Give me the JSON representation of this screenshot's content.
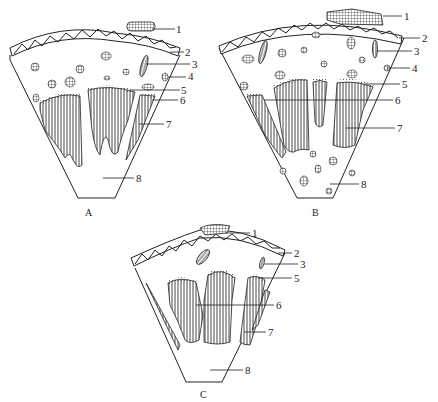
{
  "figure": {
    "panels": [
      {
        "id": "A",
        "caption": "A",
        "labels": [
          "1",
          "2",
          "3",
          "4",
          "5",
          "6",
          "7",
          "8"
        ]
      },
      {
        "id": "B",
        "caption": "B",
        "labels": [
          "1",
          "2",
          "3",
          "4",
          "5",
          "6",
          "7",
          "8"
        ]
      },
      {
        "id": "C",
        "caption": "C",
        "labels": [
          "1",
          "2",
          "3",
          "5",
          "6",
          "7",
          "8"
        ]
      }
    ],
    "colors": {
      "ink": "#222222",
      "background": "#ffffff"
    }
  }
}
